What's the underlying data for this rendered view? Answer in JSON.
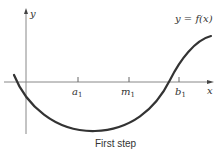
{
  "diagram": {
    "curve_label": "y = f(x)",
    "caption": "First step",
    "axes": {
      "x_label": "x",
      "y_label": "y"
    },
    "ticks": [
      {
        "name": "a",
        "sub": "1"
      },
      {
        "name": "m",
        "sub": "1"
      },
      {
        "name": "b",
        "sub": "1"
      }
    ],
    "colors": {
      "axis": "#777777",
      "curve": "#333333",
      "text": "#333333"
    }
  }
}
